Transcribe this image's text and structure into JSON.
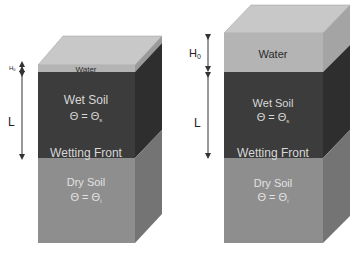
{
  "colors": {
    "water_front": "#b4b4b4",
    "water_top": "#c8c8c8",
    "water_side": "#9a9a9a",
    "wet_front": "#3c3c3c",
    "wet_side": "#2e2e2e",
    "dry_front": "#8e8e8e",
    "dry_side": "#747474",
    "wet_text": "#d8d8d8",
    "dry_text": "#e2e2e2",
    "water_text": "#2a2a2a",
    "arrow": "#333333"
  },
  "left_column": {
    "water_label": "Water",
    "ponding_label": "H",
    "ponding_sub": "0",
    "depth_label": "L",
    "wet_label": "Wet Soil",
    "wet_theta": "Θ = Θ",
    "wet_theta_sub": "s",
    "front_label": "Wetting Front",
    "dry_label": "Dry Soil",
    "dry_theta": "Θ = Θ",
    "dry_theta_sub": "i"
  },
  "right_column": {
    "water_label": "Water",
    "ponding_label": "H",
    "ponding_sub": "0",
    "depth_label": "L",
    "wet_label": "Wet Soil",
    "wet_theta": "Θ = Θ",
    "wet_theta_sub": "s",
    "front_label": "Wetting Front",
    "dry_label": "Dry Soil",
    "dry_theta": "Θ = Θ",
    "dry_theta_sub": "i"
  }
}
